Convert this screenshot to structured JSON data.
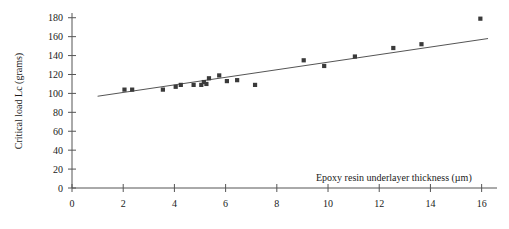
{
  "chart_data": {
    "type": "scatter",
    "title": "",
    "xlabel": "Epoxy resin underlayer thickness (µm)",
    "ylabel": "Critical load Lc (grams)",
    "xlim": [
      0,
      16.6
    ],
    "ylim": [
      0,
      185
    ],
    "xticks": [
      0,
      2,
      4,
      6,
      8,
      10,
      12,
      14,
      16
    ],
    "yticks": [
      0,
      20,
      40,
      60,
      80,
      100,
      120,
      140,
      160,
      180
    ],
    "xtick_labels": [
      "0",
      "2",
      "4",
      "6",
      "8",
      "10",
      "12",
      "14",
      "16"
    ],
    "ytick_labels": [
      "0",
      "20",
      "40",
      "60",
      "80",
      "100",
      "120",
      "140",
      "160",
      "180"
    ],
    "grid": false,
    "legend": null,
    "marker": "square",
    "marker_color": "#3a3a3a",
    "points": [
      {
        "x": 2.05,
        "y": 104
      },
      {
        "x": 2.35,
        "y": 104
      },
      {
        "x": 3.55,
        "y": 104
      },
      {
        "x": 4.05,
        "y": 107
      },
      {
        "x": 4.25,
        "y": 109
      },
      {
        "x": 4.75,
        "y": 109
      },
      {
        "x": 5.05,
        "y": 109
      },
      {
        "x": 5.15,
        "y": 112
      },
      {
        "x": 5.25,
        "y": 110
      },
      {
        "x": 5.35,
        "y": 116
      },
      {
        "x": 5.75,
        "y": 119
      },
      {
        "x": 6.05,
        "y": 113
      },
      {
        "x": 6.45,
        "y": 114
      },
      {
        "x": 7.15,
        "y": 109
      },
      {
        "x": 9.05,
        "y": 135
      },
      {
        "x": 9.85,
        "y": 129
      },
      {
        "x": 11.05,
        "y": 139
      },
      {
        "x": 12.55,
        "y": 148
      },
      {
        "x": 13.65,
        "y": 152
      },
      {
        "x": 15.95,
        "y": 179
      }
    ],
    "fit_line": {
      "type": "linear",
      "x_start": 1.0,
      "y_start": 97,
      "x_end": 16.25,
      "y_end": 158
    }
  }
}
